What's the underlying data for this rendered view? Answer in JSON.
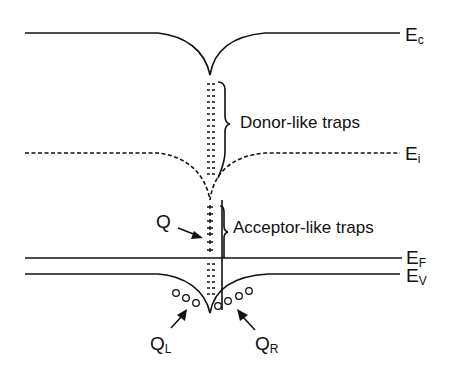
{
  "diagram": {
    "levels": [
      {
        "id": "Ec",
        "main": "E",
        "sub": "c",
        "style": "solid"
      },
      {
        "id": "Ei",
        "main": "E",
        "sub": "i",
        "style": "dashed"
      },
      {
        "id": "EF",
        "main": "E",
        "sub": "F",
        "style": "solid"
      },
      {
        "id": "Ev",
        "main": "E",
        "sub": "V",
        "style": "solid"
      }
    ],
    "annotations": {
      "donor": "Donor-like traps",
      "acceptor": "Acceptor-like traps",
      "q": "Q",
      "ql_main": "Q",
      "ql_sub": "L",
      "qr_main": "Q",
      "qr_sub": "R"
    },
    "colors": {
      "ink": "#111111",
      "background": "#ffffff"
    }
  }
}
